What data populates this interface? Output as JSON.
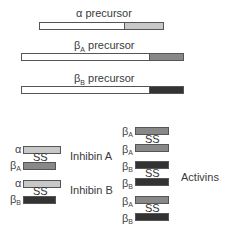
{
  "precursors": [
    {
      "label_greek": "α",
      "label_sub": "",
      "label_text": " precursor",
      "color": "#c8c8c8"
    },
    {
      "label_greek": "β",
      "label_sub": "A",
      "label_text": " precursor",
      "color": "#888888"
    },
    {
      "label_greek": "β",
      "label_sub": "B",
      "label_text": " precursor",
      "color": "#333333"
    }
  ],
  "disulfide_label": "SS",
  "inhibins": [
    {
      "name": "Inhibin A",
      "top": {
        "greek": "α",
        "sub": ""
      },
      "bottom": {
        "greek": "β",
        "sub": "A"
      }
    },
    {
      "name": "Inhibin B",
      "top": {
        "greek": "α",
        "sub": ""
      },
      "bottom": {
        "greek": "β",
        "sub": "B"
      }
    }
  ],
  "activins_label": "Activins",
  "activins": [
    {
      "top": {
        "greek": "β",
        "sub": "A"
      },
      "bottom": {
        "greek": "β",
        "sub": "A"
      }
    },
    {
      "top": {
        "greek": "β",
        "sub": "B"
      },
      "bottom": {
        "greek": "β",
        "sub": "B"
      }
    },
    {
      "top": {
        "greek": "β",
        "sub": "A"
      },
      "bottom": {
        "greek": "β",
        "sub": "B"
      }
    }
  ],
  "colors": {
    "alpha": "#c8c8c8",
    "betaA": "#888888",
    "betaB": "#333333"
  }
}
